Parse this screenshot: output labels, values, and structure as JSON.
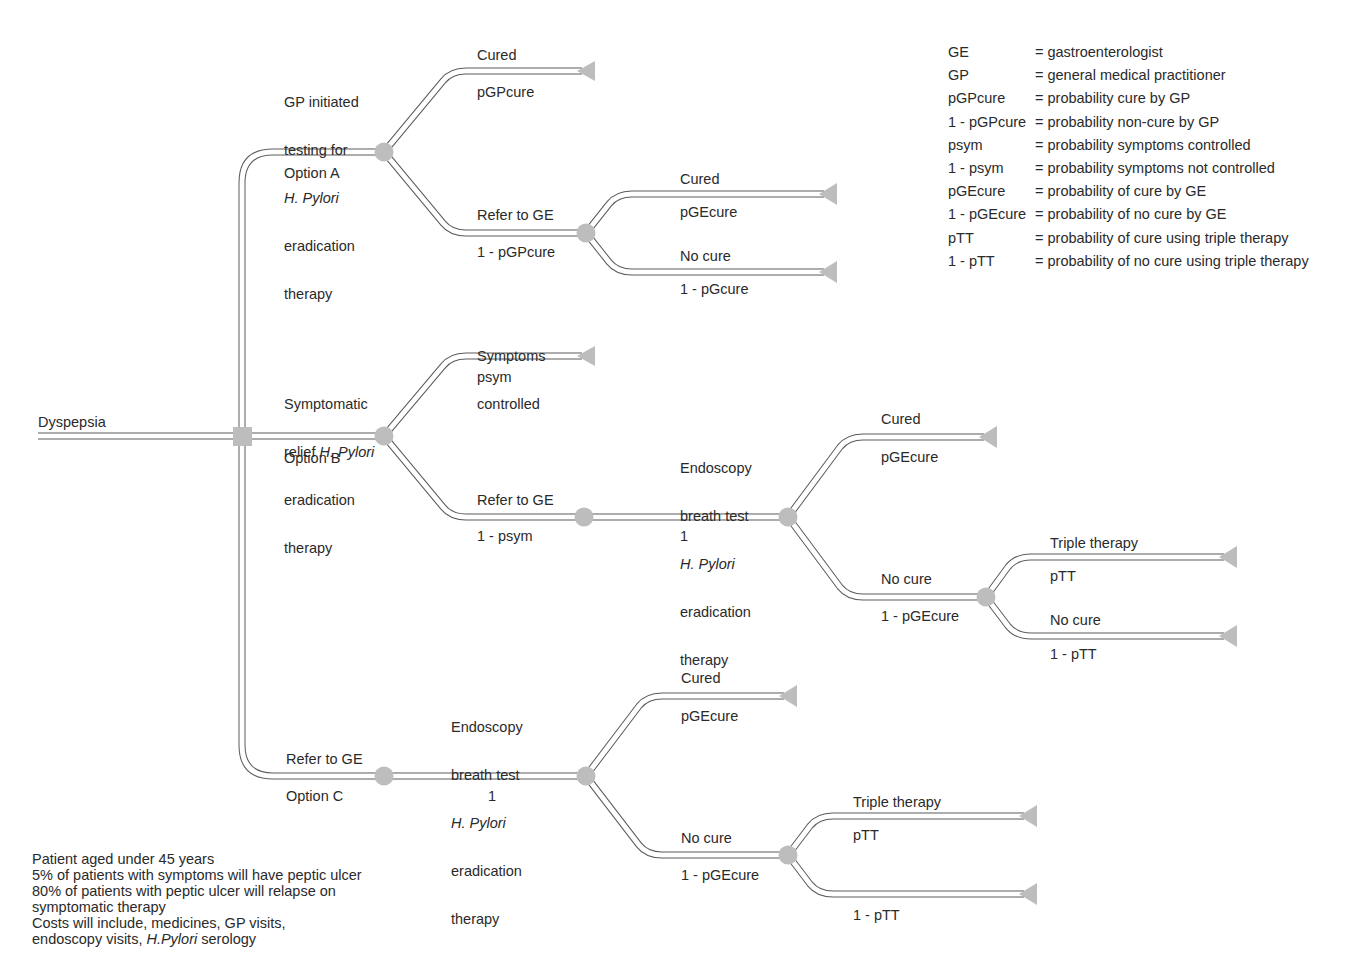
{
  "root": {
    "label": "Dyspepsia"
  },
  "options": [
    {
      "id": "A",
      "action_lines": [
        "GP initiated",
        "testing for",
        "H. Pylori",
        "eradication",
        "therapy"
      ],
      "action_italic_line": 2,
      "option_label": "Option A",
      "branches": [
        {
          "outcome": "Cured",
          "probability": "pGPcure"
        },
        {
          "outcome": "Refer to GE",
          "probability": "1 - pGPcure",
          "branches": [
            {
              "outcome": "Cured",
              "probability": "pGEcure"
            },
            {
              "outcome": "No cure",
              "probability": "1 - pGcure"
            }
          ]
        }
      ]
    },
    {
      "id": "B",
      "action_lines": [
        "Symptomatic",
        "relief H. Pylori",
        "eradication",
        "therapy"
      ],
      "action_line2_prefix": "relief ",
      "action_line2_italic": "H. Pylori",
      "option_label": "Option B",
      "branches": [
        {
          "outcome_lines": [
            "Symptoms",
            "controlled"
          ],
          "probability": "psym"
        },
        {
          "outcome": "Refer to GE",
          "probability": "1 - psym",
          "next": {
            "action_lines": [
              "Endoscopy",
              "breath test",
              "H. Pylori",
              "eradication",
              "therapy"
            ],
            "probability": "1",
            "branches": [
              {
                "outcome": "Cured",
                "probability": "pGEcure"
              },
              {
                "outcome": "No cure",
                "probability": "1 - pGEcure",
                "branches": [
                  {
                    "outcome": "Triple therapy",
                    "probability": "pTT"
                  },
                  {
                    "outcome": "No cure",
                    "probability": "1 - pTT"
                  }
                ]
              }
            ]
          }
        }
      ]
    },
    {
      "id": "C",
      "action": "Refer to GE",
      "option_label": "Option C",
      "next": {
        "action_lines": [
          "Endoscopy",
          "breath test",
          "H. Pylori",
          "eradication",
          "therapy"
        ],
        "probability": "1",
        "branches": [
          {
            "outcome": "Cured",
            "probability": "pGEcure"
          },
          {
            "outcome": "No cure",
            "probability": "1 - pGEcure",
            "branches": [
              {
                "outcome": "Triple therapy",
                "probability": "pTT"
              },
              {
                "outcome": "",
                "probability": "1 - pTT"
              }
            ]
          }
        ]
      }
    }
  ],
  "legend": [
    {
      "term": "GE",
      "definition": "= gastroenterologist"
    },
    {
      "term": "GP",
      "definition": "= general medical practitioner"
    },
    {
      "term": "pGPcure",
      "definition": "= probability cure by GP"
    },
    {
      "term": "1 - pGPcure",
      "definition": "= probability non-cure by GP"
    },
    {
      "term": "psym",
      "definition": "= probability symptoms controlled"
    },
    {
      "term": "1 - psym",
      "definition": "= probability symptoms not controlled"
    },
    {
      "term": "pGEcure",
      "definition": "= probability of cure by GE"
    },
    {
      "term": "1 - pGEcure",
      "definition": "= probability of no cure by GE"
    },
    {
      "term": "pTT",
      "definition": "= probability of cure using triple therapy"
    },
    {
      "term": "1 - pTT",
      "definition": "= probability of no cure using triple therapy"
    }
  ],
  "notes": {
    "line1": "Patient aged under 45 years",
    "line2": "5% of patients with symptoms will have peptic ulcer",
    "line3": "80% of patients with peptic ulcer will relapse on",
    "line4": "symptomatic therapy",
    "line5": "Costs will include, medicines, GP visits,",
    "line6_prefix": "endoscopy visits, ",
    "line6_italic": "H.Pylori",
    "line6_suffix": " serology"
  },
  "colors": {
    "node_fill": "#bdbdbd",
    "line": "#5a5a5a",
    "text": "#2a2a2a"
  }
}
